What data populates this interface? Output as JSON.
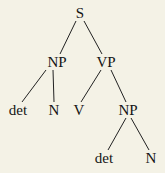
{
  "diagram": {
    "type": "syntax-tree",
    "background": "#f4f2e6",
    "line_color": "#222222",
    "nodes": [
      {
        "id": "s",
        "label": "S",
        "x": 80,
        "y": 13
      },
      {
        "id": "np1",
        "label": "NP",
        "x": 57,
        "y": 62
      },
      {
        "id": "vp",
        "label": "VP",
        "x": 106,
        "y": 62
      },
      {
        "id": "det1",
        "label": "det",
        "x": 18,
        "y": 110
      },
      {
        "id": "n1",
        "label": "N",
        "x": 54,
        "y": 110
      },
      {
        "id": "v",
        "label": "V",
        "x": 79,
        "y": 110
      },
      {
        "id": "np2",
        "label": "NP",
        "x": 128,
        "y": 110
      },
      {
        "id": "det2",
        "label": "det",
        "x": 104,
        "y": 158
      },
      {
        "id": "n2",
        "label": "N",
        "x": 151,
        "y": 158
      }
    ],
    "edges": [
      {
        "from": "s",
        "to": "np1",
        "x1": 76,
        "y1": 21,
        "x2": 60,
        "y2": 54
      },
      {
        "from": "s",
        "to": "vp",
        "x1": 84,
        "y1": 21,
        "x2": 102,
        "y2": 54
      },
      {
        "from": "np1",
        "to": "det1",
        "x1": 46,
        "y1": 70,
        "x2": 22,
        "y2": 102
      },
      {
        "from": "np1",
        "to": "n1",
        "x1": 53,
        "y1": 70,
        "x2": 54,
        "y2": 102
      },
      {
        "from": "vp",
        "to": "v",
        "x1": 101,
        "y1": 70,
        "x2": 81,
        "y2": 102
      },
      {
        "from": "vp",
        "to": "np2",
        "x1": 111,
        "y1": 70,
        "x2": 126,
        "y2": 102
      },
      {
        "from": "np2",
        "to": "det2",
        "x1": 126,
        "y1": 118,
        "x2": 108,
        "y2": 150
      },
      {
        "from": "np2",
        "to": "n2",
        "x1": 131,
        "y1": 118,
        "x2": 149,
        "y2": 150
      }
    ]
  }
}
